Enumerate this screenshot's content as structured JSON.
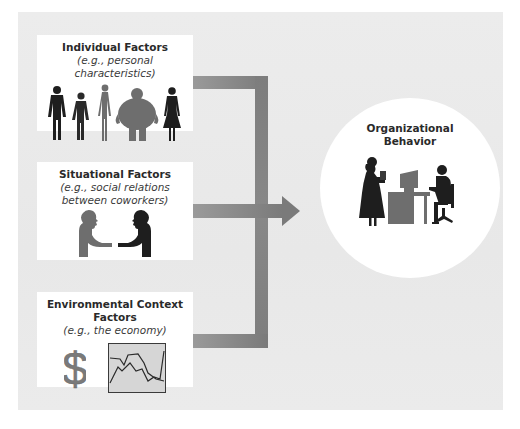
{
  "diagram": {
    "type": "flow",
    "inputs": [
      {
        "title": "Individual Factors",
        "subtitle_lines": [
          "(e.g., personal characteristics)"
        ],
        "icon": "people-silhouettes-icon"
      },
      {
        "title": "Situational Factors",
        "subtitle_lines": [
          "(e.g., social relations",
          "between coworkers)"
        ],
        "icon": "handshake-silhouettes-icon"
      },
      {
        "title": "Environmental Context Factors",
        "subtitle_lines": [
          "(e.g., the economy)"
        ],
        "icon": "dollar-and-line-chart-icon"
      }
    ],
    "output": {
      "title_lines": [
        "Organizational",
        "Behavior"
      ],
      "icon": "office-workers-silhouette-icon"
    },
    "colors": {
      "panel_background": "#ebebeb",
      "box_background": "#ffffff",
      "connector": "#838383",
      "silhouette_dark": "#1e1e1e",
      "silhouette_gray": "#6e6e6e",
      "chart_fill": "#d6d6d6"
    }
  }
}
